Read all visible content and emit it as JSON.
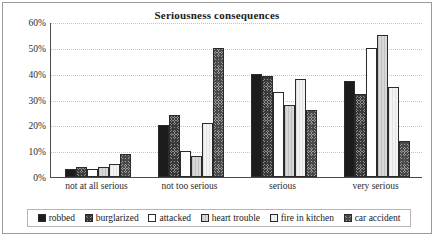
{
  "chart_data": {
    "type": "bar",
    "title": "Seriousness consequences",
    "xlabel": "",
    "ylabel": "",
    "ylim": [
      0,
      60
    ],
    "ytick_labels": [
      "0%",
      "10%",
      "20%",
      "30%",
      "40%",
      "50%",
      "60%"
    ],
    "ytick_values": [
      0,
      10,
      20,
      30,
      40,
      50,
      60
    ],
    "grid": true,
    "legend_position": "bottom",
    "categories": [
      "not at all serious",
      "not too serious",
      "serious",
      "very serious"
    ],
    "series": [
      {
        "name": "robbed",
        "values": [
          3,
          20,
          40,
          37
        ]
      },
      {
        "name": "burglarized",
        "values": [
          4,
          24,
          39,
          32
        ]
      },
      {
        "name": "attacked",
        "values": [
          3,
          10,
          33,
          50
        ]
      },
      {
        "name": "heart trouble",
        "values": [
          4,
          8,
          28,
          55
        ]
      },
      {
        "name": "fire in kitchen",
        "values": [
          5,
          21,
          38,
          35
        ]
      },
      {
        "name": "car accident",
        "values": [
          9,
          50,
          26,
          14
        ]
      }
    ]
  },
  "legend": {
    "items": [
      {
        "label": "robbed"
      },
      {
        "label": "burglarized"
      },
      {
        "label": "attacked"
      },
      {
        "label": "heart trouble"
      },
      {
        "label": "fire in kitchen"
      },
      {
        "label": "car accident"
      }
    ]
  }
}
